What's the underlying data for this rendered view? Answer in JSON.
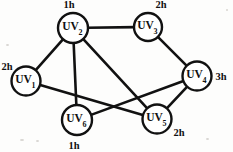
{
  "figure": {
    "type": "undirected-graph-diagram",
    "background_color": "#fdfdfc",
    "stroke_color": "#111111",
    "node_fill": "#ffffff"
  },
  "graph_data": {
    "type": "graph",
    "node_prefix": "UV",
    "nodes": [
      {
        "id": "UV1",
        "prefix": "UV",
        "index": "1",
        "weight": "2h",
        "cx": 26,
        "cy": 81,
        "r": 14.5,
        "label_dx": -19,
        "label_dy": -11
      },
      {
        "id": "UV2",
        "prefix": "UV",
        "index": "2",
        "weight": "1h",
        "cx": 73,
        "cy": 28,
        "r": 15.0,
        "label_dx": -4,
        "label_dy": -20
      },
      {
        "id": "UV3",
        "prefix": "UV",
        "index": "3",
        "weight": "2h",
        "cx": 148,
        "cy": 27,
        "r": 14.0,
        "label_dx": 13,
        "label_dy": -19
      },
      {
        "id": "UV4",
        "prefix": "UV",
        "index": "4",
        "weight": "3h",
        "cx": 197,
        "cy": 76,
        "r": 14.5,
        "label_dx": 24,
        "label_dy": 4
      },
      {
        "id": "UV5",
        "prefix": "UV",
        "index": "5",
        "weight": "2h",
        "cx": 157,
        "cy": 119,
        "r": 14.5,
        "label_dx": 22,
        "label_dy": 17
      },
      {
        "id": "UV6",
        "prefix": "UV",
        "index": "6",
        "weight": "1h",
        "cx": 77,
        "cy": 120,
        "r": 15.0,
        "label_dx": -3,
        "label_dy": 29
      }
    ],
    "edges": [
      {
        "from": "UV2",
        "to": "UV3"
      },
      {
        "from": "UV1",
        "to": "UV2"
      },
      {
        "from": "UV2",
        "to": "UV6"
      },
      {
        "from": "UV2",
        "to": "UV5"
      },
      {
        "from": "UV3",
        "to": "UV4"
      },
      {
        "from": "UV1",
        "to": "UV5"
      },
      {
        "from": "UV6",
        "to": "UV4"
      },
      {
        "from": "UV5",
        "to": "UV4"
      }
    ]
  }
}
